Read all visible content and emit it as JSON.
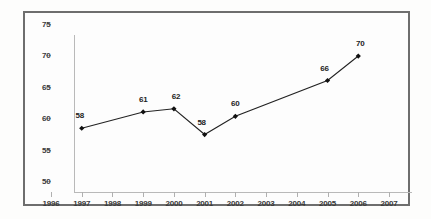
{
  "chart_data": {
    "type": "line",
    "title": "",
    "subtitle": "",
    "xlabel": "",
    "ylabel": "",
    "xlim": [
      1996,
      2007
    ],
    "ylim": [
      50,
      75
    ],
    "grid": false,
    "legend": null,
    "x_tick_labels": [
      "1996",
      "1997",
      "1998",
      "1999",
      "2000",
      "2001",
      "2002",
      "2003",
      "2004",
      "2005",
      "2006",
      "2007"
    ],
    "x_ticks": [
      1996,
      1997,
      1998,
      1999,
      2000,
      2001,
      2002,
      2003,
      2004,
      2005,
      2006,
      2007
    ],
    "y_tick_labels": [
      "50",
      "55",
      "60",
      "65",
      "70",
      "75"
    ],
    "y_ticks": [
      50,
      55,
      60,
      65,
      70,
      75
    ],
    "marker": "diamond",
    "line_color": "#222222",
    "marker_color": "#111111",
    "axis_color": "#b9b9b9",
    "frame_color": "#6e6e6e",
    "background": "#fdfdfd",
    "series": [
      {
        "name": "",
        "x": [
          1997,
          1999,
          2000,
          2001,
          2002,
          2005,
          2006
        ],
        "values": [
          58.4,
          61.0,
          61.5,
          57.4,
          60.3,
          66.0,
          69.9
        ],
        "point_labels": [
          "58",
          "61",
          "62",
          "58",
          "60",
          "66",
          "70"
        ]
      }
    ]
  }
}
